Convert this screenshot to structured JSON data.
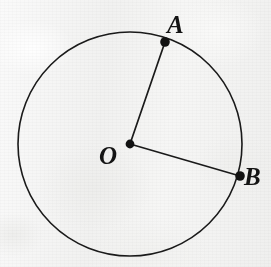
{
  "figure": {
    "kind": "geometry-diagram",
    "background_color": "#f4f4f3",
    "stroke_color": "#1a1a1a",
    "label_color": "#141414"
  },
  "circle": {
    "name": "circle-O",
    "center_x": 130,
    "center_y": 144,
    "radius": 112,
    "stroke_width": 1.6,
    "fill": "none"
  },
  "points": [
    {
      "id": "O",
      "label": "O",
      "role": "center",
      "x": 130,
      "y": 144,
      "dot_radius": 4.4,
      "label_x": 99,
      "label_y": 143
    },
    {
      "id": "A",
      "label": "A",
      "role": "on-circle",
      "x": 165,
      "y": 42,
      "dot_radius": 4.8,
      "label_x": 167,
      "label_y": 12
    },
    {
      "id": "B",
      "label": "B",
      "role": "on-circle",
      "x": 240,
      "y": 176,
      "dot_radius": 4.8,
      "label_x": 244,
      "label_y": 164
    }
  ],
  "segments": [
    {
      "id": "OA",
      "name": "radius-OA",
      "from": "O",
      "to": "A",
      "x1": 130,
      "y1": 144,
      "x2": 165,
      "y2": 42,
      "stroke_width": 1.7
    },
    {
      "id": "OB",
      "name": "radius-OB",
      "from": "O",
      "to": "B",
      "x1": 130,
      "y1": 144,
      "x2": 240,
      "y2": 176,
      "stroke_width": 1.7
    }
  ],
  "labels": {
    "A": "A",
    "B": "B",
    "O": "O"
  }
}
